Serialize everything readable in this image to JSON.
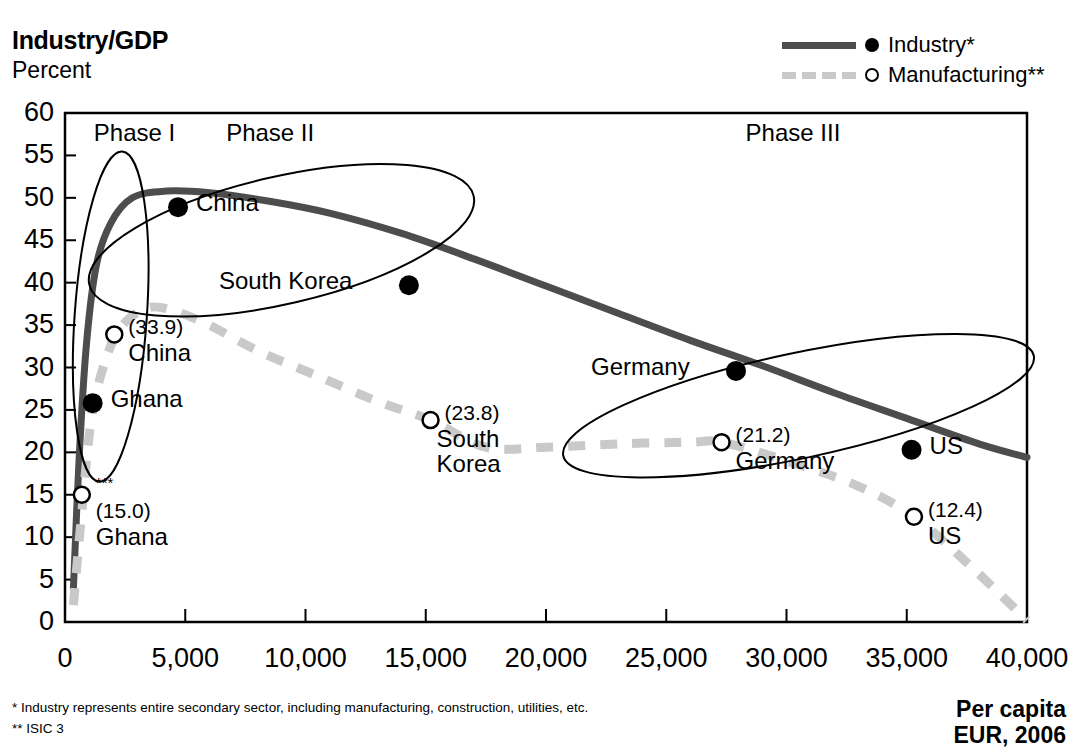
{
  "header": {
    "title": "Industry/GDP",
    "subtitle": "Percent"
  },
  "legend": {
    "position": "top-right",
    "items": [
      {
        "label": "Industry*",
        "style": "solid",
        "marker": "filled-circle",
        "color": "#4d4d4d"
      },
      {
        "label": "Manufacturing**",
        "style": "dashed",
        "marker": "open-circle",
        "color": "#c9c9c9"
      }
    ]
  },
  "axis_caption": {
    "line1": "Per capita",
    "line2": "EUR, 2006"
  },
  "footnotes": [
    "*  Industry represents entire secondary sector, including manufacturing, construction, utilities, etc.",
    "**  ISIC 3"
  ],
  "annotations": {
    "phases": [
      {
        "label": "Phase I",
        "x": 1200
      },
      {
        "label": "Phase II",
        "x": 6700
      },
      {
        "label": "Phase III",
        "x": 28300
      }
    ]
  },
  "chart_data": {
    "type": "line",
    "title": "Industry/GDP",
    "subtitle": "Percent",
    "xlabel": "Per capita EUR, 2006",
    "ylabel": "Percent",
    "xlim": [
      0,
      40000
    ],
    "ylim": [
      0,
      60
    ],
    "xticks": [
      0,
      5000,
      10000,
      15000,
      20000,
      25000,
      30000,
      35000,
      40000
    ],
    "xticklabels": [
      "0",
      "5,000",
      "10,000",
      "15,000",
      "20,000",
      "25,000",
      "30,000",
      "35,000",
      "40,000"
    ],
    "yticks": [
      0,
      5,
      10,
      15,
      20,
      25,
      30,
      35,
      40,
      45,
      50,
      55,
      60
    ],
    "yticklabels": [
      "0",
      "5",
      "10",
      "15",
      "20",
      "25",
      "30",
      "35",
      "40",
      "45",
      "50",
      "55",
      "60"
    ],
    "grid": false,
    "legend_position": "top-right",
    "series": [
      {
        "name": "Industry*",
        "style": "solid",
        "color": "#4d4d4d",
        "x": [
          350,
          600,
          900,
          1300,
          1900,
          2800,
          4200,
          6000,
          8500,
          11000,
          14000,
          17000,
          20000,
          23000,
          26000,
          29000,
          32000,
          35000,
          38000,
          40000
        ],
        "y": [
          4.0,
          20.0,
          33.0,
          42.0,
          47.0,
          50.0,
          50.8,
          50.6,
          49.6,
          48.2,
          45.8,
          42.8,
          39.6,
          36.4,
          33.2,
          30.2,
          27.0,
          24.0,
          21.0,
          19.4
        ]
      },
      {
        "name": "Manufacturing**",
        "style": "dashed",
        "color": "#c9c9c9",
        "x": [
          350,
          700,
          1100,
          1700,
          2400,
          3400,
          4400,
          6000,
          8000,
          10500,
          13000,
          15200,
          17500,
          20000,
          23000,
          26000,
          27300,
          30000,
          33000,
          35300,
          37500,
          40000
        ],
        "y": [
          2.0,
          13.0,
          24.0,
          31.0,
          35.0,
          37.0,
          36.8,
          35.0,
          32.0,
          29.0,
          26.0,
          23.8,
          20.6,
          20.6,
          21.0,
          21.2,
          21.2,
          19.0,
          16.0,
          12.4,
          7.0,
          0.2
        ]
      }
    ],
    "points": [
      {
        "country": "Ghana",
        "series": "Industry*",
        "marker": "filled-circle",
        "x": 1150,
        "y": 25.8,
        "value_label": "",
        "name_label": "Ghana",
        "label_dx": 18,
        "label_dy": -17
      },
      {
        "country": "China",
        "series": "Industry*",
        "marker": "filled-circle",
        "x": 4700,
        "y": 48.9,
        "value_label": "",
        "name_label": "China",
        "label_dx": 18,
        "label_dy": -17
      },
      {
        "country": "South Korea",
        "series": "Industry*",
        "marker": "filled-circle",
        "x": 14300,
        "y": 39.7,
        "value_label": "",
        "name_label": "South Korea",
        "label_dx": -190,
        "label_dy": -17
      },
      {
        "country": "Germany",
        "series": "Industry*",
        "marker": "filled-circle",
        "x": 27900,
        "y": 29.6,
        "value_label": "",
        "name_label": "Germany",
        "label_dx": -145,
        "label_dy": -17
      },
      {
        "country": "US",
        "series": "Industry*",
        "marker": "filled-circle",
        "x": 35200,
        "y": 20.3,
        "value_label": "",
        "name_label": "US",
        "label_dx": 18,
        "label_dy": -17
      },
      {
        "country": "Ghana",
        "series": "Manufacturing**",
        "marker": "open-circle",
        "x": 700,
        "y": 15.0,
        "value_label": "(15.0)",
        "footnote_marker": "***",
        "name_label": "Ghana",
        "label_dx": 14,
        "label_dy": -20
      },
      {
        "country": "China",
        "series": "Manufacturing**",
        "marker": "open-circle",
        "x": 2050,
        "y": 33.9,
        "value_label": "(33.9)",
        "name_label": "China",
        "label_dx": 14,
        "label_dy": -18
      },
      {
        "country": "South Korea",
        "series": "Manufacturing**",
        "marker": "open-circle",
        "x": 15200,
        "y": 23.8,
        "value_label": "(23.8)",
        "name_label": "South Korea",
        "label_dx": 14,
        "label_dy": -18
      },
      {
        "country": "Germany",
        "series": "Manufacturing**",
        "marker": "open-circle",
        "x": 27300,
        "y": 21.2,
        "value_label": "(21.2)",
        "name_label": "Germany",
        "label_dx": 14,
        "label_dy": -18
      },
      {
        "country": "US",
        "series": "Manufacturing**",
        "marker": "open-circle",
        "x": 35300,
        "y": 12.4,
        "value_label": "(12.4)",
        "name_label": "US",
        "label_dx": 14,
        "label_dy": -18
      }
    ],
    "group_ellipses": [
      {
        "name": "phase-i-ellipse",
        "cx": 1900,
        "cy": 36.0,
        "rx": 1500,
        "ry": 19.5,
        "rotate": 4
      },
      {
        "name": "phase-ii-ellipse",
        "cx": 9000,
        "cy": 45.0,
        "rx": 8200,
        "ry": 7.5,
        "rotate": -13
      },
      {
        "name": "phase-iii-ellipse",
        "cx": 30500,
        "cy": 25.5,
        "rx": 10000,
        "ry": 6.2,
        "rotate": -12
      }
    ]
  }
}
